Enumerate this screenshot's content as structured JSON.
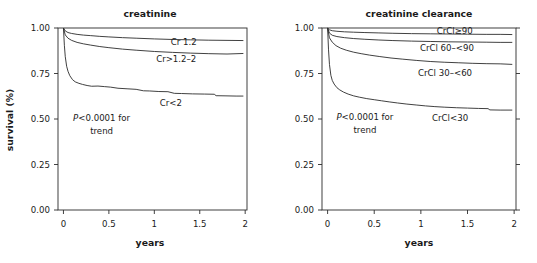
{
  "figure": {
    "name": "survival-curves-creatinine-and-creatinine-clearance",
    "panel_count": 2,
    "line_color": "#2b2b2b",
    "background": "#ffffff"
  },
  "chart_data": [
    {
      "type": "line",
      "panel": "left",
      "title": "creatinine",
      "xlabel": "years",
      "ylabel": "survival (%)",
      "xlim": [
        -0.06,
        2.02
      ],
      "ylim": [
        0.0,
        1.0
      ],
      "xticks": [
        0,
        0.5,
        1,
        1.5,
        2
      ],
      "xticklabels": [
        "0",
        "0.5",
        "1",
        "1.5",
        "2"
      ],
      "yticks": [
        0.0,
        0.25,
        0.5,
        0.75,
        1.0
      ],
      "yticklabels": [
        "0.00",
        "0.25",
        "0.50",
        "0.75",
        "1.00"
      ],
      "grid": false,
      "legend": "inline-labels",
      "annotation": {
        "line1": "P<0.0001 for",
        "line2": "trend",
        "x": 0.42,
        "y": 0.49
      },
      "series": [
        {
          "name": "Cr 1.2",
          "label": "Cr  1.2",
          "label_x": 1.18,
          "label_y": 0.922,
          "x": [
            0,
            0.02,
            0.05,
            0.09,
            0.15,
            0.22,
            0.3,
            0.4,
            0.5,
            0.65,
            0.8,
            1.0,
            1.2,
            1.4,
            1.6,
            1.8,
            1.98
          ],
          "y": [
            1.0,
            0.984,
            0.975,
            0.97,
            0.965,
            0.961,
            0.958,
            0.954,
            0.951,
            0.947,
            0.944,
            0.94,
            0.937,
            0.935,
            0.933,
            0.932,
            0.931
          ]
        },
        {
          "name": "Cr>1.2-2",
          "label": "Cr>1.2–2",
          "label_x": 1.02,
          "label_y": 0.828,
          "x": [
            0,
            0.02,
            0.05,
            0.09,
            0.15,
            0.22,
            0.3,
            0.4,
            0.5,
            0.65,
            0.8,
            1.0,
            1.2,
            1.4,
            1.6,
            1.8,
            1.98
          ],
          "y": [
            1.0,
            0.962,
            0.944,
            0.932,
            0.921,
            0.913,
            0.906,
            0.898,
            0.892,
            0.884,
            0.878,
            0.871,
            0.866,
            0.862,
            0.859,
            0.857,
            0.86
          ]
        },
        {
          "name": "Cr<2",
          "label": "Cr<2",
          "label_x": 1.06,
          "label_y": 0.588,
          "x": [
            0,
            0.01,
            0.02,
            0.035,
            0.05,
            0.07,
            0.1,
            0.13,
            0.17,
            0.21,
            0.26,
            0.31,
            0.38,
            0.45,
            0.52,
            0.6,
            0.7,
            0.8,
            0.88,
            0.95,
            1.05,
            1.15,
            1.22,
            1.3,
            1.42,
            1.55,
            1.66,
            1.68,
            1.8,
            1.9,
            1.98
          ],
          "y": [
            1.0,
            0.905,
            0.842,
            0.79,
            0.762,
            0.738,
            0.716,
            0.704,
            0.696,
            0.69,
            0.684,
            0.68,
            0.681,
            0.678,
            0.675,
            0.669,
            0.666,
            0.663,
            0.655,
            0.654,
            0.651,
            0.65,
            0.641,
            0.64,
            0.638,
            0.637,
            0.636,
            0.628,
            0.627,
            0.626,
            0.626
          ]
        }
      ]
    },
    {
      "type": "line",
      "panel": "right",
      "title": "creatinine clearance",
      "xlabel": "years",
      "ylabel": "",
      "xlim": [
        -0.06,
        2.02
      ],
      "ylim": [
        0.0,
        1.0
      ],
      "xticks": [
        0,
        0.5,
        1,
        1.5,
        2
      ],
      "xticklabels": [
        "0",
        "0.5",
        "1",
        "1.5",
        "2"
      ],
      "yticks": [
        0.0,
        0.25,
        0.5,
        0.75,
        1.0
      ],
      "yticklabels": [
        "0.00",
        "0.25",
        "0.50",
        "0.75",
        "1.00"
      ],
      "grid": false,
      "legend": "inline-labels",
      "annotation": {
        "line1": "P<0.0001 for",
        "line2": "trend",
        "x": 0.4,
        "y": 0.492
      },
      "series": [
        {
          "name": "CrCl>=90",
          "label": "CrCl≥90",
          "label_x": 1.17,
          "label_y": 0.983,
          "x": [
            0,
            0.02,
            0.05,
            0.1,
            0.18,
            0.28,
            0.4,
            0.55,
            0.7,
            0.9,
            1.1,
            1.3,
            1.5,
            1.7,
            1.85,
            1.98
          ],
          "y": [
            1.0,
            0.99,
            0.985,
            0.982,
            0.979,
            0.977,
            0.975,
            0.973,
            0.971,
            0.969,
            0.968,
            0.967,
            0.966,
            0.965,
            0.965,
            0.964
          ]
        },
        {
          "name": "CrCl 60-<90",
          "label": "CrCl 60–<90",
          "label_x": 0.99,
          "label_y": 0.888,
          "x": [
            0,
            0.02,
            0.05,
            0.1,
            0.18,
            0.28,
            0.4,
            0.55,
            0.7,
            0.9,
            1.1,
            1.3,
            1.5,
            1.7,
            1.85,
            1.98
          ],
          "y": [
            1.0,
            0.972,
            0.96,
            0.953,
            0.947,
            0.942,
            0.938,
            0.934,
            0.931,
            0.928,
            0.926,
            0.924,
            0.923,
            0.922,
            0.921,
            0.921
          ]
        },
        {
          "name": "CrCl 30-<60",
          "label": "CrCl 30–<60",
          "label_x": 0.97,
          "label_y": 0.753,
          "x": [
            0,
            0.02,
            0.05,
            0.09,
            0.14,
            0.2,
            0.28,
            0.36,
            0.45,
            0.56,
            0.68,
            0.8,
            0.95,
            1.1,
            1.25,
            1.4,
            1.55,
            1.7,
            1.85,
            1.98
          ],
          "y": [
            1.0,
            0.946,
            0.922,
            0.903,
            0.889,
            0.878,
            0.867,
            0.859,
            0.851,
            0.843,
            0.835,
            0.829,
            0.822,
            0.816,
            0.812,
            0.809,
            0.806,
            0.804,
            0.803,
            0.8
          ]
        },
        {
          "name": "CrCl<30",
          "label": "CrCl<30",
          "label_x": 1.12,
          "label_y": 0.505,
          "x": [
            0,
            0.01,
            0.02,
            0.035,
            0.05,
            0.07,
            0.1,
            0.13,
            0.17,
            0.22,
            0.28,
            0.34,
            0.42,
            0.5,
            0.58,
            0.66,
            0.75,
            0.85,
            0.95,
            1.05,
            1.15,
            1.25,
            1.38,
            1.5,
            1.62,
            1.72,
            1.74,
            1.85,
            1.98
          ],
          "y": [
            1.0,
            0.88,
            0.8,
            0.74,
            0.712,
            0.692,
            0.672,
            0.66,
            0.648,
            0.637,
            0.627,
            0.62,
            0.612,
            0.606,
            0.6,
            0.594,
            0.588,
            0.582,
            0.577,
            0.572,
            0.568,
            0.565,
            0.562,
            0.56,
            0.558,
            0.557,
            0.55,
            0.549,
            0.549
          ]
        }
      ]
    }
  ]
}
